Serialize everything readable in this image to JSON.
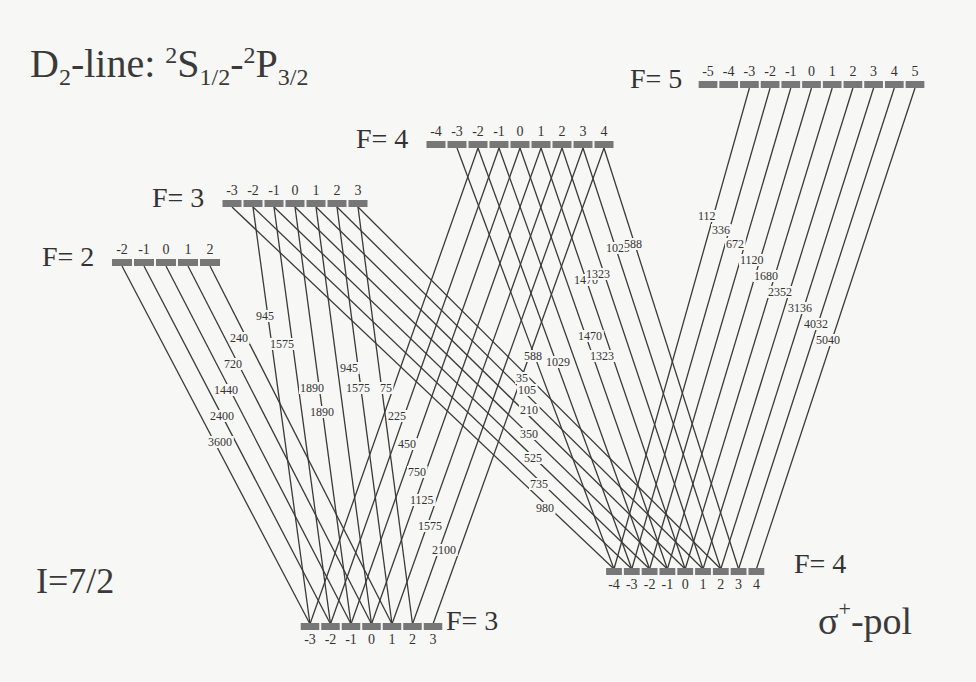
{
  "title": {
    "prefix": "D",
    "prefix_sub": "2",
    "mid": "-line: ",
    "s_sup": "2",
    "s": "S",
    "s_sub": "1/2",
    "dash": "-",
    "p_sup": "2",
    "p": "P",
    "p_sub": "3/2"
  },
  "nuclear_spin": "I=7/2",
  "polarization": {
    "sigma": "σ",
    "sup": "+",
    "suffix": "-pol"
  },
  "levels": {
    "upper": [
      {
        "label": "F= 2",
        "F": 2,
        "x0": 122,
        "dx": 22,
        "y": 262,
        "label_x": 42,
        "label_y": 266
      },
      {
        "label": "F= 3",
        "F": 3,
        "x0": 232,
        "dx": 21,
        "y": 203,
        "label_x": 152,
        "label_y": 207
      },
      {
        "label": "F= 4",
        "F": 4,
        "x0": 436,
        "dx": 21,
        "y": 144,
        "label_x": 356,
        "label_y": 148
      },
      {
        "label": "F= 5",
        "F": 5,
        "x0": 708,
        "dx": 20.7,
        "y": 84,
        "label_x": 630,
        "label_y": 88
      }
    ],
    "lower": [
      {
        "label": "F= 3",
        "F": 3,
        "x0": 310,
        "dx": 20.5,
        "y": 626,
        "label_x": 446,
        "label_y": 630
      },
      {
        "label": "F= 4",
        "F": 4,
        "x0": 614,
        "dx": 17.8,
        "y": 571,
        "label_x": 794,
        "label_y": 573
      }
    ]
  },
  "transitions": [
    {
      "from_upper": 2,
      "to_lower": 3,
      "coefficients": [
        {
          "m_lower": -3,
          "value": "3600"
        },
        {
          "m_lower": -2,
          "value": "2400"
        },
        {
          "m_lower": -1,
          "value": "1440"
        },
        {
          "m_lower": 0,
          "value": "720"
        },
        {
          "m_lower": 1,
          "value": "240"
        }
      ]
    },
    {
      "from_upper": 3,
      "to_lower": 3,
      "coefficients": [
        {
          "m_lower": -3,
          "value": "945"
        },
        {
          "m_lower": -2,
          "value": "1575"
        },
        {
          "m_lower": -1,
          "value": "1890"
        },
        {
          "m_lower": 0,
          "value": "1890"
        },
        {
          "m_lower": 1,
          "value": "1575"
        },
        {
          "m_lower": 2,
          "value": "945"
        }
      ]
    },
    {
      "from_upper": 4,
      "to_lower": 3,
      "coefficients": [
        {
          "m_lower": -3,
          "value": "75"
        },
        {
          "m_lower": -2,
          "value": "225"
        },
        {
          "m_lower": -1,
          "value": "450"
        },
        {
          "m_lower": 0,
          "value": "750"
        },
        {
          "m_lower": 1,
          "value": "1125"
        },
        {
          "m_lower": 2,
          "value": "1575"
        },
        {
          "m_lower": 3,
          "value": "2100"
        }
      ]
    },
    {
      "from_upper": 3,
      "to_lower": 4,
      "coefficients": [
        {
          "m_lower": -4,
          "value": "980"
        },
        {
          "m_lower": -3,
          "value": "735"
        },
        {
          "m_lower": -2,
          "value": "525"
        },
        {
          "m_lower": -1,
          "value": "350"
        },
        {
          "m_lower": 0,
          "value": "210"
        },
        {
          "m_lower": 1,
          "value": "105"
        },
        {
          "m_lower": 2,
          "value": "35"
        }
      ]
    },
    {
      "from_upper": 4,
      "to_lower": 4,
      "coefficients": [
        {
          "m_lower": -4,
          "value": "588"
        },
        {
          "m_lower": -3,
          "value": "1029"
        },
        {
          "m_lower": -2,
          "value": "1323"
        },
        {
          "m_lower": -1,
          "value": "1470"
        },
        {
          "m_lower": 0,
          "value": "1470"
        },
        {
          "m_lower": 1,
          "value": "1323"
        },
        {
          "m_lower": 2,
          "value": "1029"
        },
        {
          "m_lower": 3,
          "value": "588"
        }
      ]
    },
    {
      "from_upper": 5,
      "to_lower": 4,
      "coefficients": [
        {
          "m_lower": -4,
          "value": "112"
        },
        {
          "m_lower": -3,
          "value": "336"
        },
        {
          "m_lower": -2,
          "value": "672"
        },
        {
          "m_lower": -1,
          "value": "1120"
        },
        {
          "m_lower": 0,
          "value": "1680"
        },
        {
          "m_lower": 1,
          "value": "2352"
        },
        {
          "m_lower": 2,
          "value": "3136"
        },
        {
          "m_lower": 3,
          "value": "4032"
        },
        {
          "m_lower": 4,
          "value": "5040"
        }
      ]
    }
  ],
  "coef_label_positions": {
    "2-3": [
      [
        208,
        446
      ],
      [
        210,
        420
      ],
      [
        214,
        394
      ],
      [
        224,
        368
      ],
      [
        230,
        342
      ]
    ],
    "3-3": [
      [
        256,
        320
      ],
      [
        270,
        348
      ],
      [
        300,
        392
      ],
      [
        310,
        416
      ],
      [
        346,
        392
      ],
      [
        340,
        372
      ]
    ],
    "4-3": [
      [
        380,
        392
      ],
      [
        388,
        420
      ],
      [
        398,
        448
      ],
      [
        408,
        476
      ],
      [
        410,
        504
      ],
      [
        418,
        530
      ],
      [
        432,
        554
      ]
    ],
    "3-4": [
      [
        536,
        512
      ],
      [
        530,
        488
      ],
      [
        524,
        462
      ],
      [
        520,
        438
      ],
      [
        520,
        414
      ],
      [
        518,
        394
      ],
      [
        516,
        382
      ]
    ],
    "4-4": [
      [
        524,
        360
      ],
      [
        546,
        366
      ],
      [
        590,
        360
      ],
      [
        578,
        340
      ],
      [
        574,
        284
      ],
      [
        586,
        278
      ],
      [
        606,
        252
      ],
      [
        624,
        248
      ]
    ],
    "5-4": [
      [
        698,
        220
      ],
      [
        712,
        234
      ],
      [
        726,
        248
      ],
      [
        740,
        264
      ],
      [
        754,
        280
      ],
      [
        768,
        296
      ],
      [
        788,
        312
      ],
      [
        804,
        328
      ],
      [
        816,
        344
      ]
    ]
  },
  "colors": {
    "background": "#f7f7f5",
    "line": "#3a3a3a",
    "bar": "#777777",
    "text": "#333333"
  }
}
